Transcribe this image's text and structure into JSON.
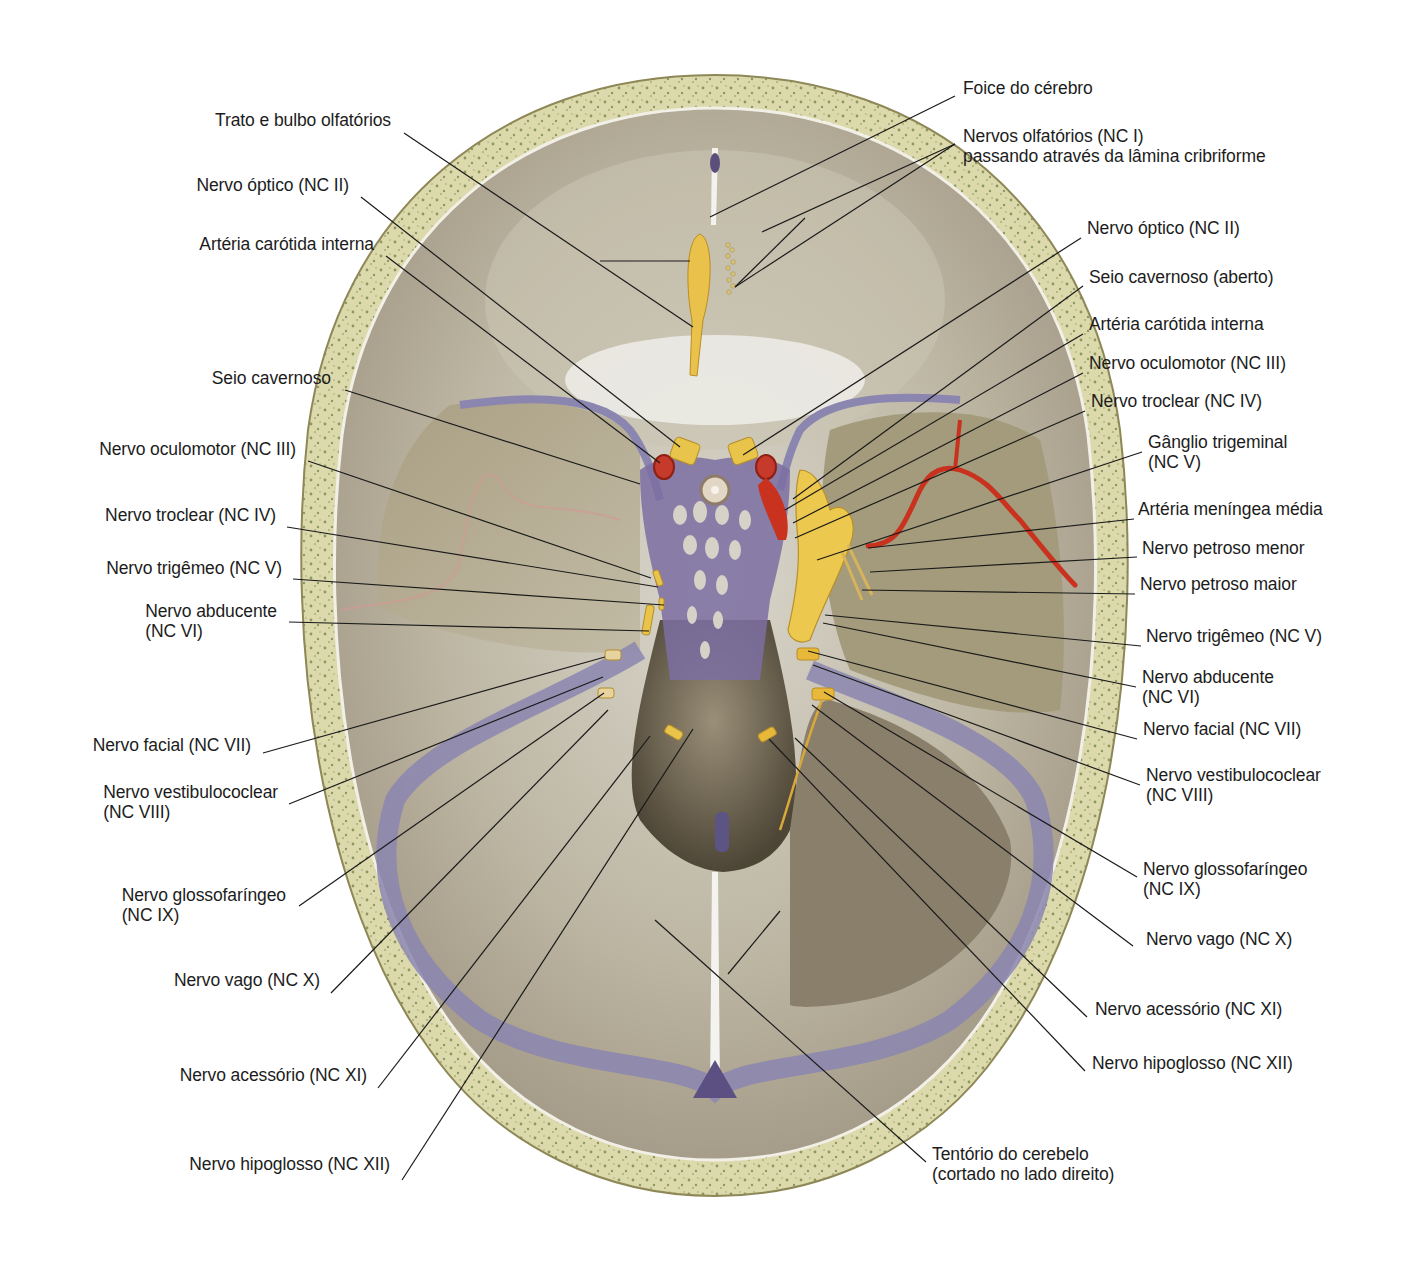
{
  "figure": {
    "colors": {
      "bone_outer": "#d9d6aa",
      "bone_spot": "#8f9a60",
      "fossa_floor": "#bdb5a0",
      "fossa_dark": "#7d7360",
      "dura_light": "#e6e4dd",
      "venous_sinus": "#8b86b0",
      "nerve": "#e8c44a",
      "artery": "#c8321e",
      "leader_line": "#1a1a1a"
    }
  },
  "labels_left": [
    {
      "id": "trato-bulbo-olfatorios",
      "text": "Trato e bulbo olfatórios",
      "x": 397,
      "y": 120
    },
    {
      "id": "nervo-optico-l",
      "text": "Nervo óptico (NC II)",
      "x": 355,
      "y": 185
    },
    {
      "id": "arteria-carotida-interna-l",
      "text": "Artéria carótida interna",
      "x": 380,
      "y": 244
    },
    {
      "id": "seio-cavernoso-l",
      "text": "Seio cavernoso",
      "x": 337,
      "y": 378
    },
    {
      "id": "nervo-oculomotor-l",
      "text": "Nervo oculomotor (NC III)",
      "x": 302,
      "y": 449
    },
    {
      "id": "nervo-troclear-l",
      "text": "Nervo troclear (NC IV)",
      "x": 282,
      "y": 515
    },
    {
      "id": "nervo-trigemeo-l",
      "text": "Nervo trigêmeo (NC V)",
      "x": 288,
      "y": 568
    },
    {
      "id": "nervo-abducente-l",
      "text": "Nervo abducente\n(NC VI)",
      "x": 283,
      "y": 611,
      "align": "lefttext"
    },
    {
      "id": "nervo-facial-l",
      "text": "Nervo facial (NC VII)",
      "x": 257,
      "y": 745
    },
    {
      "id": "nervo-vestibulococlear-l",
      "text": "Nervo vestibulococlear\n(NC VIII)",
      "x": 284,
      "y": 792,
      "align": "lefttext"
    },
    {
      "id": "nervo-glossofaringeo-l",
      "text": "Nervo glossofaríngeo\n(NC IX)",
      "x": 292,
      "y": 895,
      "align": "lefttext"
    },
    {
      "id": "nervo-vago-l",
      "text": "Nervo vago (NC X)",
      "x": 326,
      "y": 980
    },
    {
      "id": "nervo-acessorio-l",
      "text": "Nervo acessório (NC XI)",
      "x": 373,
      "y": 1075
    },
    {
      "id": "nervo-hipoglosso-l",
      "text": "Nervo hipoglosso (NC XII)",
      "x": 396,
      "y": 1164
    }
  ],
  "labels_right": [
    {
      "id": "foice-do-cerebro",
      "text": "Foice do cérebro",
      "x": 963,
      "y": 88
    },
    {
      "id": "nervos-olfatorios",
      "text": "Nervos olfatórios (NC I)\npassando através da lâmina cribriforme",
      "x": 963,
      "y": 136
    },
    {
      "id": "nervo-optico-r",
      "text": "Nervo óptico (NC II)",
      "x": 1087,
      "y": 228
    },
    {
      "id": "seio-cavernoso-aberto",
      "text": "Seio cavernoso (aberto)",
      "x": 1089,
      "y": 277
    },
    {
      "id": "arteria-carotida-interna-r",
      "text": "Artéria carótida interna",
      "x": 1089,
      "y": 324
    },
    {
      "id": "nervo-oculomotor-r",
      "text": "Nervo oculomotor (NC III)",
      "x": 1089,
      "y": 363
    },
    {
      "id": "nervo-troclear-r",
      "text": "Nervo troclear (NC IV)",
      "x": 1091,
      "y": 401
    },
    {
      "id": "ganglio-trigeminal",
      "text": "Gânglio trigeminal\n(NC V)",
      "x": 1148,
      "y": 442
    },
    {
      "id": "arteria-meningea-media",
      "text": "Artéria meníngea média",
      "x": 1138,
      "y": 509
    },
    {
      "id": "nervo-petroso-menor",
      "text": "Nervo petroso menor",
      "x": 1142,
      "y": 548
    },
    {
      "id": "nervo-petroso-maior",
      "text": "Nervo petroso maior",
      "x": 1140,
      "y": 584
    },
    {
      "id": "nervo-trigemeo-r",
      "text": "Nervo trigêmeo (NC V)",
      "x": 1146,
      "y": 636
    },
    {
      "id": "nervo-abducente-r",
      "text": "Nervo abducente\n(NC VI)",
      "x": 1142,
      "y": 677
    },
    {
      "id": "nervo-facial-r",
      "text": "Nervo facial (NC VII)",
      "x": 1143,
      "y": 729
    },
    {
      "id": "nervo-vestibulococlear-r",
      "text": "Nervo vestibulococlear\n(NC VIII)",
      "x": 1146,
      "y": 775
    },
    {
      "id": "nervo-glossofaringeo-r",
      "text": "Nervo glossofaríngeo\n(NC IX)",
      "x": 1143,
      "y": 869
    },
    {
      "id": "nervo-vago-r",
      "text": "Nervo vago (NC X)",
      "x": 1146,
      "y": 939
    },
    {
      "id": "nervo-acessorio-r",
      "text": "Nervo acessório (NC XI)",
      "x": 1095,
      "y": 1009
    },
    {
      "id": "nervo-hipoglosso-r",
      "text": "Nervo hipoglosso (NC XII)",
      "x": 1092,
      "y": 1063
    }
  ],
  "labels_bottom": [
    {
      "id": "tentorio-do-cerebelo",
      "text": "Tentório do cerebelo\n(cortado no lado direito)",
      "x": 932,
      "y": 1154
    }
  ],
  "leaders": [
    [
      404,
      133,
      693,
      327
    ],
    [
      361,
      197,
      680,
      447
    ],
    [
      386,
      256,
      660,
      463
    ],
    [
      345,
      390,
      640,
      484
    ],
    [
      308,
      461,
      651,
      578
    ],
    [
      287,
      527,
      658,
      587
    ],
    [
      293,
      579,
      664,
      605
    ],
    [
      289,
      622,
      649,
      631
    ],
    [
      263,
      753,
      605,
      657
    ],
    [
      289,
      804,
      603,
      677
    ],
    [
      299,
      906,
      604,
      693
    ],
    [
      331,
      993,
      608,
      710
    ],
    [
      378,
      1088,
      650,
      736
    ],
    [
      402,
      1180,
      693,
      729
    ],
    [
      955,
      96,
      710,
      217
    ],
    [
      955,
      144,
      762,
      232
    ],
    [
      955,
      144,
      735,
      287
    ],
    [
      600,
      261,
      690,
      261
    ],
    [
      805,
      218,
      735,
      287
    ],
    [
      1081,
      238,
      743,
      455
    ],
    [
      1083,
      286,
      793,
      499
    ],
    [
      1083,
      334,
      785,
      510
    ],
    [
      1083,
      373,
      793,
      523
    ],
    [
      1085,
      411,
      795,
      538
    ],
    [
      1142,
      452,
      817,
      560
    ],
    [
      1134,
      519,
      868,
      548
    ],
    [
      1137,
      557,
      870,
      572
    ],
    [
      1135,
      594,
      862,
      590
    ],
    [
      1141,
      646,
      825,
      615
    ],
    [
      1136,
      687,
      823,
      623
    ],
    [
      1137,
      739,
      808,
      651
    ],
    [
      1140,
      785,
      813,
      665
    ],
    [
      1137,
      877,
      824,
      692
    ],
    [
      1133,
      946,
      812,
      705
    ],
    [
      1087,
      1017,
      795,
      738
    ],
    [
      1085,
      1071,
      769,
      739
    ],
    [
      926,
      1162,
      655,
      920
    ],
    [
      728,
      974,
      780,
      911
    ]
  ],
  "structures": {
    "olfactory_bulb": "Trato e bulbo olfatórios",
    "crista_galli": "Foice do cérebro",
    "sella_turcica": "Hipófise",
    "foramen_magnum": "Forame magno",
    "transverse_sinus": "Seio transverso",
    "confluence": "Confluência dos seios"
  }
}
